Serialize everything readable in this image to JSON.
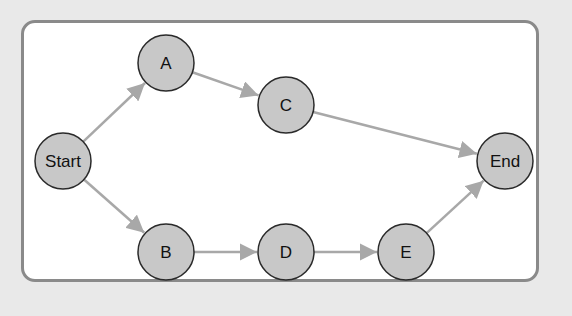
{
  "diagram": {
    "type": "flow-graph",
    "colors": {
      "node_fill": "#c8c8c8",
      "node_stroke": "#2a2a2a",
      "edge": "#a8a8a8",
      "panel_border": "#8a8a8a",
      "background": "#e9e9e9"
    },
    "nodes": [
      {
        "id": "start",
        "label": "Start",
        "x": 63,
        "y": 161
      },
      {
        "id": "a",
        "label": "A",
        "x": 166,
        "y": 63
      },
      {
        "id": "c",
        "label": "C",
        "x": 286,
        "y": 105
      },
      {
        "id": "end",
        "label": "End",
        "x": 505,
        "y": 161
      },
      {
        "id": "b",
        "label": "B",
        "x": 166,
        "y": 252
      },
      {
        "id": "d",
        "label": "D",
        "x": 286,
        "y": 252
      },
      {
        "id": "e",
        "label": "E",
        "x": 406,
        "y": 252
      }
    ],
    "edges": [
      {
        "from": "start",
        "to": "a"
      },
      {
        "from": "a",
        "to": "c"
      },
      {
        "from": "c",
        "to": "end"
      },
      {
        "from": "start",
        "to": "b"
      },
      {
        "from": "b",
        "to": "d"
      },
      {
        "from": "d",
        "to": "e"
      },
      {
        "from": "e",
        "to": "end"
      }
    ]
  }
}
